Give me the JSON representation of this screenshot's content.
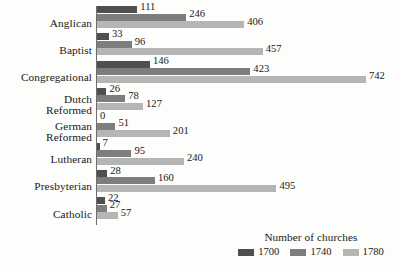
{
  "chart_data": {
    "type": "bar",
    "orientation": "horizontal",
    "title": "",
    "xlabel": "",
    "ylabel": "",
    "legend_title": "Number of churches",
    "legend_position": "bottom-right",
    "grid": false,
    "xlim": [
      0,
      742
    ],
    "categories": [
      "Anglican",
      "Baptist",
      "Congregational",
      "Dutch\nReformed",
      "German\nReformed",
      "Lutheran",
      "Presbyterian",
      "Catholic"
    ],
    "series": [
      {
        "name": "1700",
        "color": "#4f4f4f",
        "values": [
          111,
          33,
          146,
          26,
          0,
          7,
          28,
          22
        ]
      },
      {
        "name": "1740",
        "color": "#7d7d7d",
        "values": [
          246,
          96,
          423,
          78,
          51,
          95,
          160,
          27
        ]
      },
      {
        "name": "1780",
        "color": "#b5b5b5",
        "values": [
          406,
          457,
          742,
          127,
          201,
          240,
          495,
          57
        ]
      }
    ]
  },
  "legend": {
    "title": "Number of churches",
    "entries": [
      {
        "label": "1700",
        "color": "#4f4f4f"
      },
      {
        "label": "1740",
        "color": "#7d7d7d"
      },
      {
        "label": "1780",
        "color": "#b5b5b5"
      }
    ]
  },
  "colors": {
    "background": "#fdfdfb",
    "axis": "#6d6d6d",
    "text": "#1a1a1a",
    "series_1700": "#4f4f4f",
    "series_1740": "#7d7d7d",
    "series_1780": "#b5b5b5"
  }
}
